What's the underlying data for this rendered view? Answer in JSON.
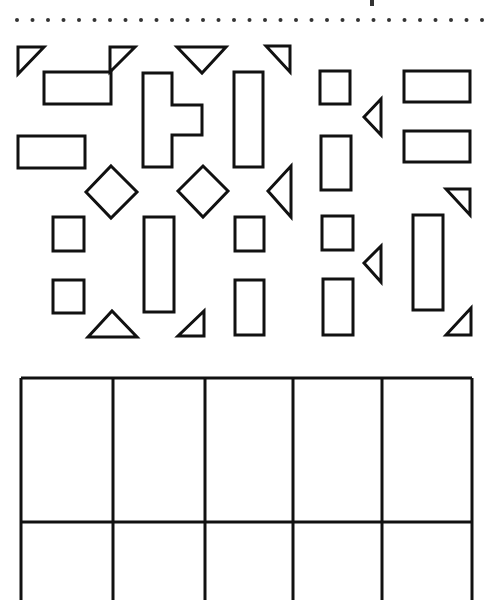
{
  "page": {
    "background": "#ffffff",
    "ink": "#111111"
  },
  "header": {
    "dotted_line": {
      "y": 20,
      "x_start": 17,
      "x_end": 490,
      "spacing": 15.5,
      "radius": 2
    },
    "cropped_glyph": {
      "x": 370,
      "y": 0,
      "w": 4,
      "h": 6
    }
  },
  "shapes": [
    {
      "id": "tri-1",
      "kind": "right-triangle",
      "points": "18,47 44,47 18,74"
    },
    {
      "id": "rect-1",
      "kind": "rectangle",
      "x": 44,
      "y": 72,
      "w": 67,
      "h": 32
    },
    {
      "id": "tri-2",
      "kind": "right-triangle",
      "points": "110,47 135,47 110,72"
    },
    {
      "id": "tri-3",
      "kind": "triangle-down",
      "points": "177,47 226,47 202,73"
    },
    {
      "id": "tri-4",
      "kind": "right-triangle",
      "points": "266,46 290,46 290,72"
    },
    {
      "id": "rect-2",
      "kind": "rectangle",
      "x": 18,
      "y": 136,
      "w": 67,
      "h": 32
    },
    {
      "id": "t-shape",
      "kind": "t-shape",
      "points": "143,73 172,73 172,105 202,105 202,135 172,135 172,167 143,167"
    },
    {
      "id": "rect-3",
      "kind": "rectangle",
      "x": 234,
      "y": 72,
      "w": 29,
      "h": 95
    },
    {
      "id": "square-1",
      "kind": "square",
      "x": 320,
      "y": 71,
      "w": 30,
      "h": 33
    },
    {
      "id": "tri-5",
      "kind": "triangle-left",
      "points": "364,117 381,99 381,135"
    },
    {
      "id": "rect-4",
      "kind": "rectangle",
      "x": 404,
      "y": 71,
      "w": 66,
      "h": 31
    },
    {
      "id": "rect-5",
      "kind": "rectangle",
      "x": 404,
      "y": 131,
      "w": 66,
      "h": 31
    },
    {
      "id": "rect-6",
      "kind": "rectangle",
      "x": 321,
      "y": 136,
      "w": 30,
      "h": 54
    },
    {
      "id": "diamond-1",
      "kind": "diamond",
      "points": "111,166 137,192 111,218 86,192"
    },
    {
      "id": "diamond-2",
      "kind": "diamond",
      "points": "203,166 228,191 203,217 178,191"
    },
    {
      "id": "tri-6",
      "kind": "triangle-left",
      "points": "268,191 291,166 291,217"
    },
    {
      "id": "tri-7",
      "kind": "right-triangle",
      "points": "446,189 470,189 470,215"
    },
    {
      "id": "square-2",
      "kind": "square",
      "x": 53,
      "y": 217,
      "w": 31,
      "h": 34
    },
    {
      "id": "rect-7",
      "kind": "rectangle",
      "x": 144,
      "y": 217,
      "w": 30,
      "h": 95
    },
    {
      "id": "square-3",
      "kind": "square",
      "x": 235,
      "y": 217,
      "w": 29,
      "h": 34
    },
    {
      "id": "square-4",
      "kind": "square",
      "x": 322,
      "y": 216,
      "w": 31,
      "h": 34
    },
    {
      "id": "tri-8",
      "kind": "triangle-left",
      "points": "364,263 381,246 381,282"
    },
    {
      "id": "rect-8",
      "kind": "rectangle",
      "x": 413,
      "y": 215,
      "w": 30,
      "h": 95
    },
    {
      "id": "square-5",
      "kind": "square",
      "x": 53,
      "y": 280,
      "w": 31,
      "h": 33
    },
    {
      "id": "tri-9",
      "kind": "triangle-up",
      "points": "88,337 137,337 112,311"
    },
    {
      "id": "tri-10",
      "kind": "right-triangle",
      "points": "178,336 204,336 204,311"
    },
    {
      "id": "rect-9",
      "kind": "rectangle",
      "x": 235,
      "y": 280,
      "w": 29,
      "h": 55
    },
    {
      "id": "rect-10",
      "kind": "rectangle",
      "x": 323,
      "y": 279,
      "w": 30,
      "h": 56
    },
    {
      "id": "tri-11",
      "kind": "right-triangle",
      "points": "446,335 471,335 471,308"
    }
  ],
  "answer_grid": {
    "x_lines": [
      21,
      113,
      205,
      293,
      382,
      472
    ],
    "y_top": 378,
    "y_mid": 522,
    "y_bottom": 600,
    "columns": 5,
    "rows_visible": 2
  }
}
